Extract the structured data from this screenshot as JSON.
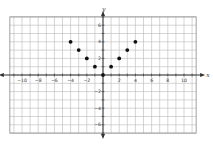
{
  "chart_data": {
    "type": "scatter",
    "title": "",
    "xlabel": "x",
    "ylabel": "y",
    "xlim": [
      -11,
      11
    ],
    "ylim": [
      -7,
      7
    ],
    "grid": true,
    "legend": null,
    "x_ticks": [
      -10,
      -8,
      -6,
      -4,
      -2,
      2,
      4,
      6,
      8,
      10
    ],
    "y_ticks": [
      -6,
      -4,
      -2,
      2,
      4,
      6
    ],
    "series": [
      {
        "name": "points",
        "points": [
          {
            "x": -4,
            "y": 4
          },
          {
            "x": -3,
            "y": 3
          },
          {
            "x": -2,
            "y": 2
          },
          {
            "x": -1,
            "y": 1
          },
          {
            "x": 0,
            "y": 0
          },
          {
            "x": 1,
            "y": 1
          },
          {
            "x": 2,
            "y": 2
          },
          {
            "x": 3,
            "y": 3
          },
          {
            "x": 4,
            "y": 4
          }
        ],
        "color": "#111111"
      }
    ]
  },
  "colors": {
    "grid": "#b9b9b9",
    "grid_border": "#8a8a8a",
    "axis": "#333333",
    "point": "#111111"
  },
  "layout": {
    "origin_px": [
      103,
      75
    ],
    "unit_x_px": 8.1,
    "unit_y_px": 8.3
  }
}
